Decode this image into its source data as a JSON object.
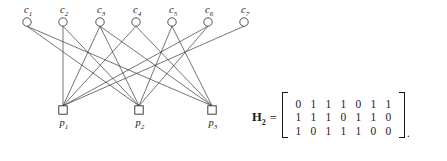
{
  "figure": {
    "type": "tanner-graph-with-parity-check-matrix",
    "background_color": "#ffffff",
    "line_color": "#3a3a3a"
  },
  "graph": {
    "check_nodes": [
      {
        "id": "c1",
        "label": "c",
        "sub": "1",
        "x": 27,
        "y": 22
      },
      {
        "id": "c2",
        "label": "c",
        "sub": "2",
        "x": 63,
        "y": 22
      },
      {
        "id": "c3",
        "label": "c",
        "sub": "3",
        "x": 100,
        "y": 22
      },
      {
        "id": "c4",
        "label": "c",
        "sub": "4",
        "x": 136,
        "y": 22
      },
      {
        "id": "c5",
        "label": "c",
        "sub": "5",
        "x": 172,
        "y": 22
      },
      {
        "id": "c6",
        "label": "c",
        "sub": "6",
        "x": 208,
        "y": 22
      },
      {
        "id": "c7",
        "label": "c",
        "sub": "7",
        "x": 244,
        "y": 22
      }
    ],
    "parity_nodes": [
      {
        "id": "p1",
        "label": "p",
        "sub": "1",
        "x": 63,
        "y": 110
      },
      {
        "id": "p2",
        "label": "p",
        "sub": "2",
        "x": 139,
        "y": 110
      },
      {
        "id": "p3",
        "label": "p",
        "sub": "3",
        "x": 212,
        "y": 110
      }
    ],
    "edges": [
      {
        "from": "c1",
        "to": "p2"
      },
      {
        "from": "c1",
        "to": "p3"
      },
      {
        "from": "c2",
        "to": "p1"
      },
      {
        "from": "c2",
        "to": "p2"
      },
      {
        "from": "c3",
        "to": "p1"
      },
      {
        "from": "c3",
        "to": "p2"
      },
      {
        "from": "c3",
        "to": "p3"
      },
      {
        "from": "c4",
        "to": "p1"
      },
      {
        "from": "c4",
        "to": "p3"
      },
      {
        "from": "c5",
        "to": "p2"
      },
      {
        "from": "c5",
        "to": "p3"
      },
      {
        "from": "c6",
        "to": "p1"
      },
      {
        "from": "c6",
        "to": "p2"
      },
      {
        "from": "c7",
        "to": "p1"
      }
    ]
  },
  "matrix": {
    "name": "H",
    "name_sub": "2",
    "equals": "=",
    "period": ".",
    "rows": [
      [
        "0",
        "1",
        "1",
        "1",
        "0",
        "1",
        "1"
      ],
      [
        "1",
        "1",
        "1",
        "0",
        "1",
        "1",
        "0"
      ],
      [
        "1",
        "0",
        "1",
        "1",
        "1",
        "0",
        "0"
      ]
    ]
  }
}
